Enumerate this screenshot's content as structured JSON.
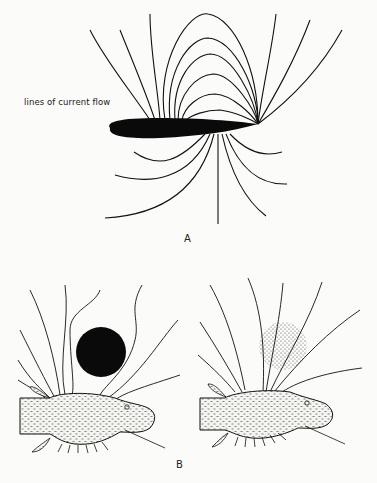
{
  "figure": {
    "panel_a": {
      "letter": "A",
      "annotation": "lines of current flow",
      "elements": [
        "elongated electric fish body (black)",
        "dipole field lines from head/tail"
      ]
    },
    "panel_b": {
      "letter": "B",
      "left": {
        "object": "non-conducting object (solid black circle)",
        "effect": "field lines diverge around object"
      },
      "right": {
        "object": "conducting object (stippled circle)",
        "effect": "field lines converge through object"
      }
    },
    "colors": {
      "ink": "#111111",
      "background": "#fbfbf9"
    }
  }
}
